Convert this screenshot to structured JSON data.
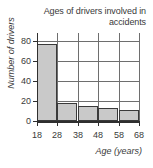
{
  "chart_data": {
    "type": "bar",
    "title": "Ages of drivers involved in accidents",
    "title_line1": "Ages of drivers involved in",
    "title_line2": "accidents",
    "xlabel": "Age (years)",
    "ylabel": "Number of drivers",
    "categories": [
      "18-28",
      "28-38",
      "38-48",
      "48-58",
      "58-68"
    ],
    "bin_edges": [
      18,
      28,
      38,
      48,
      58,
      68
    ],
    "values": [
      77,
      18,
      15,
      13,
      11
    ],
    "xlim": [
      18,
      68
    ],
    "ylim": [
      0,
      88
    ],
    "yticks": [
      0,
      20,
      40,
      60,
      80
    ],
    "ytick_labels": [
      "0",
      "20",
      "40",
      "60",
      "80"
    ],
    "xticks": [
      18,
      28,
      38,
      48,
      58,
      68
    ],
    "xtick_labels": [
      "18",
      "28",
      "38",
      "48",
      "58",
      "68"
    ],
    "grid": "horizontal-and-vertical",
    "legend": null,
    "bar_fill_color": "#c9c9c9",
    "bar_edge_color": "#3a3a3a",
    "axis_color": "#2f2f2f",
    "grid_color": "#6e6e6e"
  }
}
